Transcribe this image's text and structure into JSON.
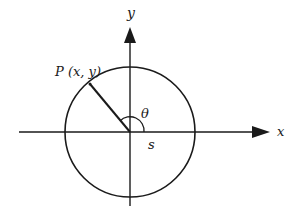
{
  "diagram": {
    "type": "unit-circle",
    "labels": {
      "x_axis": "x",
      "y_axis": "y",
      "point": "P (x, y)",
      "angle": "θ",
      "arc": "s"
    },
    "colors": {
      "stroke": "#1a1a1a",
      "background": "#ffffff"
    }
  }
}
